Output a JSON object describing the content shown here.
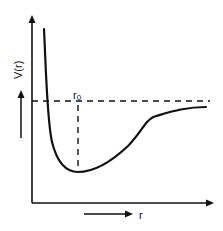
{
  "diagram": {
    "y_axis_label": "V(r)",
    "x_axis_label": "r",
    "marker_label": "r",
    "marker_subscript": "0",
    "colors": {
      "line": "#111111",
      "background": "#ffffff"
    }
  }
}
